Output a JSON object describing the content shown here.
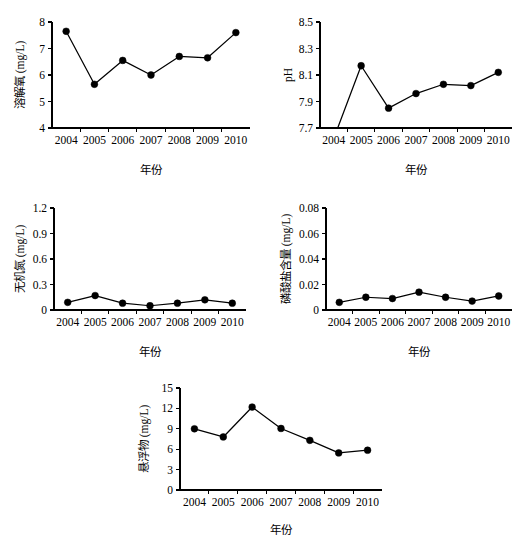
{
  "figure": {
    "background": "#ffffff",
    "line_color": "#000000",
    "marker_color": "#000000",
    "panel_count": 5
  },
  "chart_data": [
    {
      "id": "dissolved-oxygen",
      "type": "line",
      "title": "",
      "xlabel": "年份",
      "ylabel": "溶解氧 (mg/L)",
      "categories": [
        "2004",
        "2005",
        "2006",
        "2007",
        "2008",
        "2009",
        "2010"
      ],
      "values": [
        7.65,
        5.65,
        6.55,
        6.0,
        6.7,
        6.65,
        7.6
      ],
      "yticks": [
        "4",
        "5",
        "6",
        "7",
        "8"
      ],
      "ytick_values": [
        4,
        5,
        6,
        7,
        8
      ],
      "ylim": [
        4,
        8
      ],
      "grid": false,
      "legend": "none"
    },
    {
      "id": "ph",
      "type": "line",
      "title": "",
      "xlabel": "年份",
      "ylabel": "pH",
      "categories": [
        "2004",
        "2005",
        "2006",
        "2007",
        "2008",
        "2009",
        "2010"
      ],
      "values": [
        7.62,
        8.17,
        7.85,
        7.96,
        8.03,
        8.02,
        8.12
      ],
      "yticks": [
        "7.7",
        "7.9",
        "8.1",
        "8.3",
        "8.5"
      ],
      "ytick_values": [
        7.7,
        7.9,
        8.1,
        8.3,
        8.5
      ],
      "ylim": [
        7.7,
        8.5
      ],
      "grid": false,
      "legend": "none",
      "note": "2004 value falls below the plotted axis minimum; line enters from bottom axis and its marker is not drawn"
    },
    {
      "id": "inorganic-nitrogen",
      "type": "line",
      "title": "",
      "xlabel": "年份",
      "ylabel": "无机氮 (mg/L)",
      "categories": [
        "2004",
        "2005",
        "2006",
        "2007",
        "2008",
        "2009",
        "2010"
      ],
      "values": [
        0.09,
        0.17,
        0.08,
        0.05,
        0.08,
        0.12,
        0.08
      ],
      "yticks": [
        "0",
        "0.3",
        "0.6",
        "0.9",
        "1.2"
      ],
      "ytick_values": [
        0,
        0.3,
        0.6,
        0.9,
        1.2
      ],
      "ylim": [
        0,
        1.2
      ],
      "grid": false,
      "legend": "none"
    },
    {
      "id": "phosphate",
      "type": "line",
      "title": "",
      "xlabel": "年份",
      "ylabel": "磷酸盐含量 (mg/L)",
      "categories": [
        "2004",
        "2005",
        "2006",
        "2007",
        "2008",
        "2009",
        "2010"
      ],
      "values": [
        0.006,
        0.01,
        0.009,
        0.014,
        0.01,
        0.007,
        0.011
      ],
      "yticks": [
        "0",
        "0.02",
        "0.04",
        "0.06",
        "0.08"
      ],
      "ytick_values": [
        0,
        0.02,
        0.04,
        0.06,
        0.08
      ],
      "ylim": [
        0,
        0.08
      ],
      "grid": false,
      "legend": "none"
    },
    {
      "id": "suspended-solids",
      "type": "line",
      "title": "",
      "xlabel": "年份",
      "ylabel": "悬浮物 (mg/L)",
      "categories": [
        "2004",
        "2005",
        "2006",
        "2007",
        "2008",
        "2009",
        "2010"
      ],
      "values": [
        9.0,
        7.8,
        12.2,
        9.05,
        7.3,
        5.45,
        5.85
      ],
      "yticks": [
        "0",
        "3",
        "6",
        "9",
        "12",
        "15"
      ],
      "ytick_values": [
        0,
        3,
        6,
        9,
        12,
        15
      ],
      "ylim": [
        0,
        15
      ],
      "grid": false,
      "legend": "none"
    }
  ]
}
